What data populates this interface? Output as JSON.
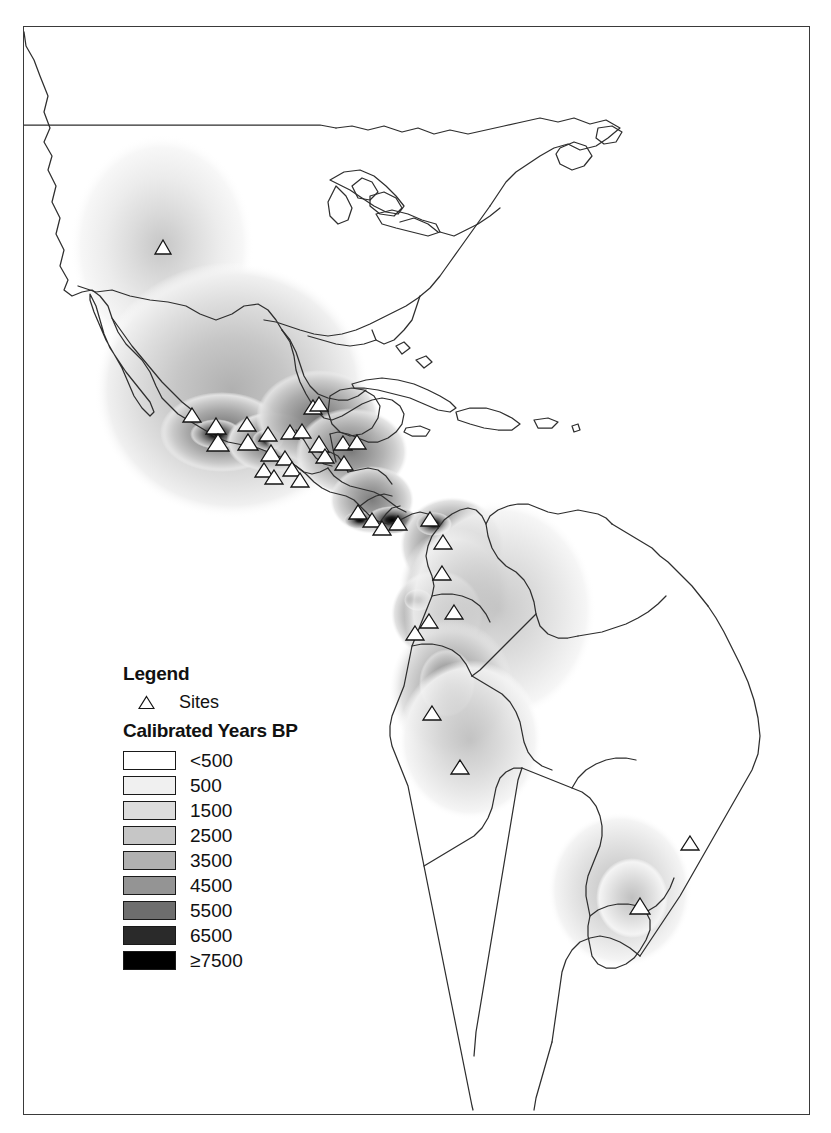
{
  "figure": {
    "kind": "thematic-map",
    "region": "Americas",
    "frame_border_color": "#3a3a3a"
  },
  "legend": {
    "title": "Legend",
    "sites": {
      "symbol": "triangle-marker",
      "label": "Sites"
    },
    "subtitle": "Calibrated Years BP",
    "classes": [
      {
        "label": "<500",
        "color": "#ffffff"
      },
      {
        "label": "500",
        "color": "#f0f0f0"
      },
      {
        "label": "1500",
        "color": "#dcdcdc"
      },
      {
        "label": "2500",
        "color": "#c6c6c6"
      },
      {
        "label": "3500",
        "color": "#b0b0b0"
      },
      {
        "label": "4500",
        "color": "#949494"
      },
      {
        "label": "5500",
        "color": "#6e6e6e"
      },
      {
        "label": "6500",
        "color": "#2a2a2a"
      },
      {
        "label": "≥7500",
        "color": "#000000"
      }
    ]
  },
  "chart_data": {
    "type": "map",
    "title": "",
    "variable": "Calibrated Years BP",
    "legend_position": "lower-left",
    "class_breaks": [
      "<500",
      "500",
      "1500",
      "2500",
      "3500",
      "4500",
      "5500",
      "6500",
      "≥7500"
    ],
    "class_colors": [
      "#ffffff",
      "#f0f0f0",
      "#dcdcdc",
      "#c6c6c6",
      "#b0b0b0",
      "#949494",
      "#6e6e6e",
      "#2a2a2a",
      "#000000"
    ],
    "point_symbol": "triangle",
    "point_series_name": "Sites",
    "hotspots": [
      {
        "name": "US Southwest",
        "max_class": "2500"
      },
      {
        "name": "West Mexico / Guerrero coast",
        "max_class": "≥7500"
      },
      {
        "name": "Oaxaca / Tehuantepec",
        "max_class": "≥7500"
      },
      {
        "name": "Guatemala / Honduras",
        "max_class": "4500"
      },
      {
        "name": "Panama isthmus",
        "max_class": "≥7500"
      },
      {
        "name": "Colombia / Ecuador Pacific",
        "max_class": "6500"
      },
      {
        "name": "Peru coast / highlands",
        "max_class": "4500"
      },
      {
        "name": "Uruguay / southern Brazil",
        "max_class": "1500"
      }
    ]
  }
}
